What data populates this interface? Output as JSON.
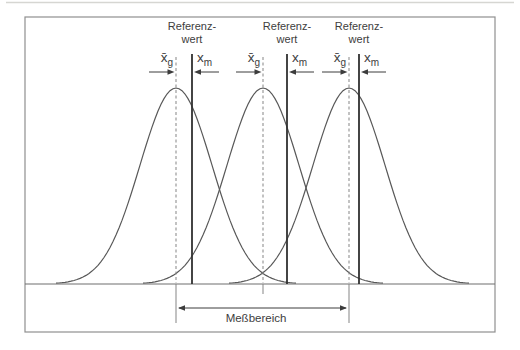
{
  "diagram": {
    "frame": {
      "x": 25,
      "y": 17,
      "w": 470,
      "h": 315,
      "color": "#8f8f8f"
    },
    "page_edge_line": {
      "y": 2.5,
      "color": "#d6d6d2"
    },
    "baseline": {
      "y": 284,
      "color": "#6e6e6e"
    },
    "curve_style": {
      "sigma": 36,
      "height": 196,
      "half_span": 120,
      "color": "#585858"
    },
    "arrow_row_y": 72,
    "label_row_top": 50,
    "ref_label_top": 20,
    "groups": [
      {
        "ref_label_line1": "Referenz-",
        "ref_label_line2": "wert",
        "mean_symbol": "x̄",
        "mean_sub": "g",
        "ref_symbol": "x",
        "ref_sub": "m",
        "mean_x": 176,
        "ref_x": 192,
        "below_tick_bottom": 323
      },
      {
        "ref_label_line1": "Referenz-",
        "ref_label_line2": "wert",
        "mean_symbol": "x̄",
        "mean_sub": "g",
        "ref_symbol": "x",
        "ref_sub": "m",
        "mean_x": 263,
        "ref_x": 287,
        "below_tick_bottom": 294
      },
      {
        "ref_label_line1": "Referenz-",
        "ref_label_line2": "wert",
        "mean_symbol": "x̄",
        "mean_sub": "g",
        "ref_symbol": "x",
        "ref_sub": "m",
        "mean_x": 349,
        "ref_x": 359,
        "below_tick_bottom": 323
      }
    ],
    "range": {
      "label": "Meßbereich",
      "x1": 177,
      "x2": 348,
      "arrow_y": 308,
      "label_center_x": 256,
      "label_top": 312
    },
    "colors": {
      "solid_line": "#303030",
      "dashed_line": "#858585",
      "arrow": "#3c3c3c",
      "text": "#3d3d3d"
    }
  }
}
